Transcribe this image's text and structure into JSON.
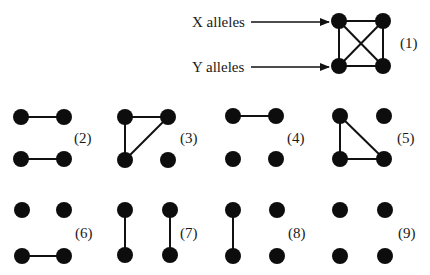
{
  "labels": {
    "x_alleles": "X alleles",
    "y_alleles": "Y alleles"
  },
  "style": {
    "node_color": "#0d0d0d",
    "edge_color": "#111111",
    "background": "#ffffff",
    "node_radius": 8
  },
  "graphs": [
    {
      "id": 1,
      "label": "(1)",
      "origin": [
        339,
        21
      ],
      "dx": 44,
      "dy": 45,
      "label_pos": [
        400,
        48
      ],
      "edges": [
        [
          "TL",
          "TR"
        ],
        [
          "BL",
          "BR"
        ],
        [
          "TL",
          "BL"
        ],
        [
          "TR",
          "BR"
        ],
        [
          "TL",
          "BR"
        ],
        [
          "TR",
          "BL"
        ]
      ]
    },
    {
      "id": 2,
      "label": "(2)",
      "origin": [
        21,
        117
      ],
      "dx": 43,
      "dy": 42,
      "label_pos": [
        74,
        143
      ],
      "edges": [
        [
          "TL",
          "TR"
        ],
        [
          "BL",
          "BR"
        ]
      ]
    },
    {
      "id": 3,
      "label": "(3)",
      "origin": [
        125,
        117
      ],
      "dx": 43,
      "dy": 43,
      "label_pos": [
        180,
        143
      ],
      "edges": [
        [
          "TL",
          "TR"
        ],
        [
          "TL",
          "BL"
        ],
        [
          "TR",
          "BL"
        ]
      ]
    },
    {
      "id": 4,
      "label": "(4)",
      "origin": [
        233,
        116
      ],
      "dx": 43,
      "dy": 43,
      "label_pos": [
        287,
        143
      ],
      "edges": [
        [
          "TL",
          "TR"
        ]
      ]
    },
    {
      "id": 5,
      "label": "(5)",
      "origin": [
        340,
        116
      ],
      "dx": 44,
      "dy": 43,
      "label_pos": [
        397,
        143
      ],
      "edges": [
        [
          "TL",
          "BL"
        ],
        [
          "TL",
          "BR"
        ],
        [
          "BL",
          "BR"
        ]
      ]
    },
    {
      "id": 6,
      "label": "(6)",
      "origin": [
        22,
        210
      ],
      "dx": 42,
      "dy": 46,
      "label_pos": [
        75,
        238
      ],
      "edges": [
        [
          "BL",
          "BR"
        ]
      ]
    },
    {
      "id": 7,
      "label": "(7)",
      "origin": [
        125,
        210
      ],
      "dx": 45,
      "dy": 45,
      "label_pos": [
        180,
        238
      ],
      "edges": [
        [
          "TL",
          "BL"
        ],
        [
          "TR",
          "BR"
        ]
      ]
    },
    {
      "id": 8,
      "label": "(8)",
      "origin": [
        233,
        210
      ],
      "dx": 44,
      "dy": 46,
      "label_pos": [
        288,
        238
      ],
      "edges": [
        [
          "TL",
          "BL"
        ]
      ]
    },
    {
      "id": 9,
      "label": "(9)",
      "origin": [
        340,
        210
      ],
      "dx": 45,
      "dy": 46,
      "label_pos": [
        398,
        238
      ],
      "edges": []
    }
  ]
}
